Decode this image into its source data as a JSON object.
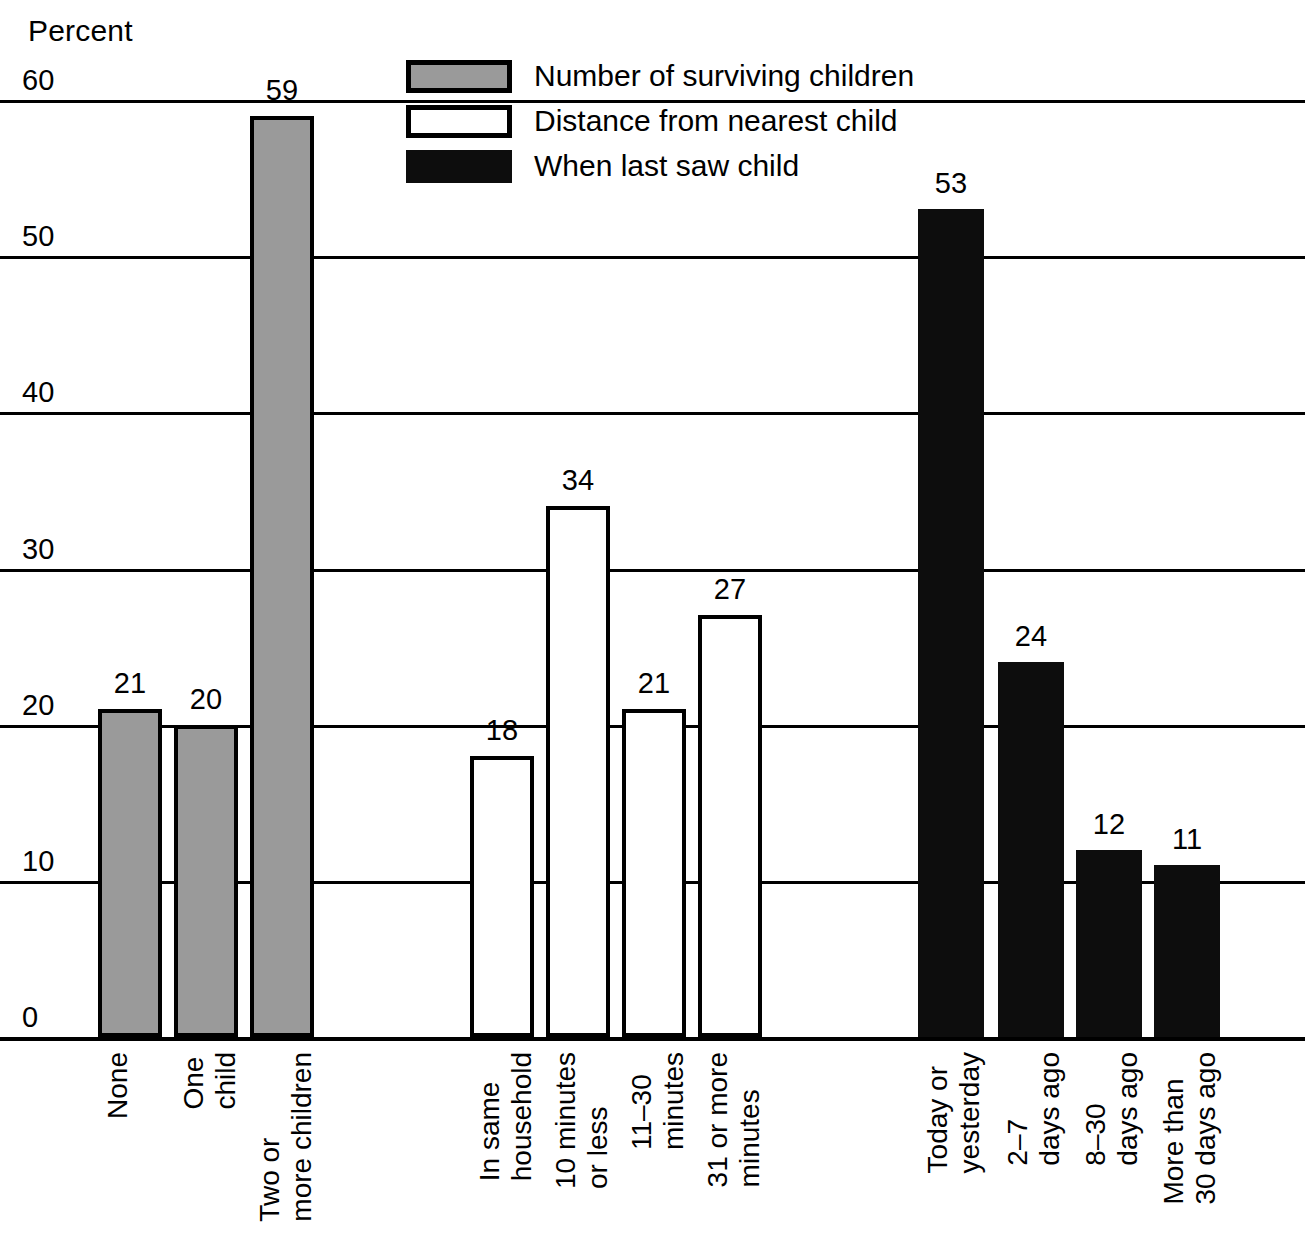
{
  "chart_data": {
    "type": "bar",
    "title": "",
    "subtitle": "",
    "xlabel": "",
    "ylabel": "Percent",
    "ylim": [
      0,
      60
    ],
    "yticks": [
      0,
      10,
      20,
      30,
      40,
      50,
      60
    ],
    "ytick_labels": [
      "0",
      "10",
      "20",
      "30",
      "40",
      "50",
      "60"
    ],
    "grid": true,
    "legend_position": "top-center",
    "orientation": "vertical",
    "value_labels": true,
    "colors": {
      "series_1": "#9a9a9a",
      "series_2": "#ffffff",
      "series_3": "#0d0d0d",
      "outline": "#000000",
      "background": "#ffffff"
    },
    "series": [
      {
        "name": "Number of surviving children",
        "fill": "gray",
        "categories": [
          "None",
          "One child",
          "Two or more children"
        ],
        "category_lines": [
          [
            "None"
          ],
          [
            "One",
            "child"
          ],
          [
            "Two or",
            "more children"
          ]
        ],
        "values": [
          21,
          20,
          59
        ]
      },
      {
        "name": "Distance from nearest child",
        "fill": "white",
        "categories": [
          "In same household",
          "10 minutes or less",
          "11–30 minutes",
          "31 or more minutes"
        ],
        "category_lines": [
          [
            "In same",
            "household"
          ],
          [
            "10 minutes",
            "or less"
          ],
          [
            "11–30",
            "minutes"
          ],
          [
            "31 or more",
            "minutes"
          ]
        ],
        "values": [
          18,
          34,
          21,
          27
        ]
      },
      {
        "name": "When last saw child",
        "fill": "black",
        "categories": [
          "Today or yesterday",
          "2–7 days ago",
          "8–30 days ago",
          "More than 30 days ago"
        ],
        "category_lines": [
          [
            "Today or",
            "yesterday"
          ],
          [
            "2–7",
            "days ago"
          ],
          [
            "8–30",
            "days ago"
          ],
          [
            "More than",
            "30 days ago"
          ]
        ],
        "values": [
          53,
          24,
          12,
          11
        ]
      }
    ],
    "bars": [
      {
        "series": 0,
        "fill": "gray",
        "label": "None",
        "lines": [
          "None"
        ],
        "value": 21,
        "x": 98,
        "width": 64
      },
      {
        "series": 0,
        "fill": "gray",
        "label": "One child",
        "lines": [
          "One",
          "child"
        ],
        "value": 20,
        "x": 174,
        "width": 64
      },
      {
        "series": 0,
        "fill": "gray",
        "label": "Two or more children",
        "lines": [
          "Two or",
          "more children"
        ],
        "value": 59,
        "x": 250,
        "width": 64
      },
      {
        "series": 1,
        "fill": "white",
        "label": "In same household",
        "lines": [
          "In same",
          "household"
        ],
        "value": 18,
        "x": 470,
        "width": 64
      },
      {
        "series": 1,
        "fill": "white",
        "label": "10 minutes or less",
        "lines": [
          "10 minutes",
          "or less"
        ],
        "value": 34,
        "x": 546,
        "width": 64
      },
      {
        "series": 1,
        "fill": "white",
        "label": "11–30 minutes",
        "lines": [
          "11–30",
          "minutes"
        ],
        "value": 21,
        "x": 622,
        "width": 64
      },
      {
        "series": 1,
        "fill": "white",
        "label": "31 or more minutes",
        "lines": [
          "31 or more",
          "minutes"
        ],
        "value": 27,
        "x": 698,
        "width": 64
      },
      {
        "series": 2,
        "fill": "black",
        "label": "Today or yesterday",
        "lines": [
          "Today or",
          "yesterday"
        ],
        "value": 53,
        "x": 918,
        "width": 66
      },
      {
        "series": 2,
        "fill": "black",
        "label": "2–7 days ago",
        "lines": [
          "2–7",
          "days ago"
        ],
        "value": 24,
        "x": 998,
        "width": 66
      },
      {
        "series": 2,
        "fill": "black",
        "label": "8–30 days ago",
        "lines": [
          "8–30",
          "days ago"
        ],
        "value": 12,
        "x": 1076,
        "width": 66
      },
      {
        "series": 2,
        "fill": "black",
        "label": "More than 30 days ago",
        "lines": [
          "More than",
          "30 days ago"
        ],
        "value": 11,
        "x": 1154,
        "width": 66
      }
    ]
  },
  "legend": {
    "items": [
      {
        "label": "Number of surviving children",
        "fill": "gray"
      },
      {
        "label": "Distance from nearest child",
        "fill": "white"
      },
      {
        "label": "When last saw child",
        "fill": "black"
      }
    ]
  }
}
